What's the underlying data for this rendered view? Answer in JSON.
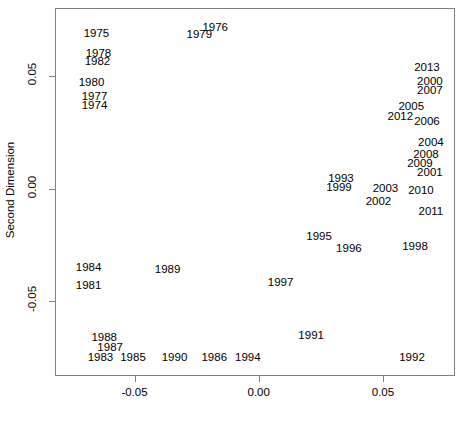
{
  "chart_data": {
    "type": "scatter",
    "title": "",
    "xlabel": "",
    "ylabel": "Second Dimension",
    "xlim": [
      -0.082,
      0.079
    ],
    "ylim": [
      -0.083,
      0.08
    ],
    "grid": false,
    "legend": null,
    "marker_style": "text-labels-only",
    "xticks": [
      -0.05,
      0.0,
      0.05
    ],
    "xticklabels": [
      "-0.05",
      "0.00",
      "0.05"
    ],
    "yticks": [
      0.05,
      0.0,
      -0.05
    ],
    "yticklabels": [
      "0.05",
      "0.00",
      "-0.05"
    ],
    "points": [
      {
        "label": "1975",
        "x": -0.0653,
        "y": 0.0684
      },
      {
        "label": "1976",
        "x": -0.0175,
        "y": 0.0711
      },
      {
        "label": "1979",
        "x": -0.0239,
        "y": 0.068
      },
      {
        "label": "1978",
        "x": -0.0645,
        "y": 0.0596
      },
      {
        "label": "1982",
        "x": -0.0649,
        "y": 0.056
      },
      {
        "label": "1980",
        "x": -0.0673,
        "y": 0.0467
      },
      {
        "label": "1977",
        "x": -0.0661,
        "y": 0.0404
      },
      {
        "label": "1974",
        "x": -0.0661,
        "y": 0.0364
      },
      {
        "label": "2013",
        "x": 0.0677,
        "y": 0.0533
      },
      {
        "label": "2000",
        "x": 0.0689,
        "y": 0.0471
      },
      {
        "label": "2007",
        "x": 0.0689,
        "y": 0.0431
      },
      {
        "label": "2005",
        "x": 0.0614,
        "y": 0.036
      },
      {
        "label": "2012",
        "x": 0.057,
        "y": 0.0316
      },
      {
        "label": "2006",
        "x": 0.0677,
        "y": 0.0293
      },
      {
        "label": "2004",
        "x": 0.0693,
        "y": 0.0204
      },
      {
        "label": "2008",
        "x": 0.0673,
        "y": 0.0151
      },
      {
        "label": "2009",
        "x": 0.0649,
        "y": 0.0107
      },
      {
        "label": "2001",
        "x": 0.0689,
        "y": 0.0067
      },
      {
        "label": "1993",
        "x": 0.0331,
        "y": 0.0044
      },
      {
        "label": "1999",
        "x": 0.0323,
        "y": 0.0004
      },
      {
        "label": "2003",
        "x": 0.051,
        "y": 0.0
      },
      {
        "label": "2010",
        "x": 0.0653,
        "y": -0.0009
      },
      {
        "label": "2002",
        "x": 0.0482,
        "y": -0.0058
      },
      {
        "label": "2011",
        "x": 0.0693,
        "y": -0.0102
      },
      {
        "label": "1995",
        "x": 0.0243,
        "y": -0.0213
      },
      {
        "label": "1998",
        "x": 0.0629,
        "y": -0.0258
      },
      {
        "label": "1996",
        "x": 0.0363,
        "y": -0.0267
      },
      {
        "label": "1984",
        "x": -0.0685,
        "y": -0.0351
      },
      {
        "label": "1989",
        "x": -0.0367,
        "y": -0.036
      },
      {
        "label": "1997",
        "x": 0.0088,
        "y": -0.0418
      },
      {
        "label": "1981",
        "x": -0.0685,
        "y": -0.0431
      },
      {
        "label": "1991",
        "x": 0.0211,
        "y": -0.0653
      },
      {
        "label": "1988",
        "x": -0.0622,
        "y": -0.0662
      },
      {
        "label": "1987",
        "x": -0.0598,
        "y": -0.0707
      },
      {
        "label": "1983",
        "x": -0.0637,
        "y": -0.0751
      },
      {
        "label": "1985",
        "x": -0.0506,
        "y": -0.0751
      },
      {
        "label": "1990",
        "x": -0.0339,
        "y": -0.0751
      },
      {
        "label": "1986",
        "x": -0.0179,
        "y": -0.0751
      },
      {
        "label": "1994",
        "x": -0.0044,
        "y": -0.0751
      },
      {
        "label": "1992",
        "x": 0.0617,
        "y": -0.0751
      }
    ]
  },
  "axes": {
    "y_title": "Second Dimension",
    "x_title": ""
  },
  "colors": {
    "frame": "#808080",
    "text": "#000000",
    "background": "#ffffff"
  }
}
